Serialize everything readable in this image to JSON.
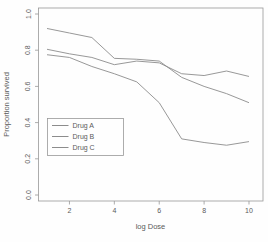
{
  "figure": {
    "background": "#fefefe",
    "axis_color": "#989898",
    "text_color": "#5a5a5a"
  },
  "chart_data": {
    "type": "line",
    "title": "",
    "xlabel": "log Dose",
    "ylabel": "Proportion survived",
    "x": [
      1,
      2,
      3,
      4,
      5,
      6,
      7,
      8,
      9,
      10
    ],
    "x_ticks": [
      2,
      4,
      6,
      8,
      10
    ],
    "y_ticks": [
      "0.0",
      "0.2",
      "0.4",
      "0.6",
      "0.8",
      "1.0"
    ],
    "xlim": [
      0.64,
      10.36
    ],
    "ylim": [
      -0.04,
      1.04
    ],
    "grid": false,
    "legend_position": "inside-left-middle",
    "legend_entries": [
      "Drug A",
      "Drug B",
      "Drug C"
    ],
    "series": [
      {
        "name": "Drug A",
        "color": "#8c8c8c",
        "values": [
          0.92,
          0.895,
          0.87,
          0.755,
          0.75,
          0.74,
          0.65,
          0.6,
          0.56,
          0.51
        ]
      },
      {
        "name": "Drug B",
        "color": "#8c8c8c",
        "values": [
          0.805,
          0.78,
          0.76,
          0.72,
          0.74,
          0.73,
          0.67,
          0.66,
          0.685,
          0.655
        ]
      },
      {
        "name": "Drug C",
        "color": "#8c8c8c",
        "values": [
          0.775,
          0.76,
          0.71,
          0.67,
          0.625,
          0.51,
          0.31,
          0.29,
          0.275,
          0.295
        ]
      }
    ]
  }
}
